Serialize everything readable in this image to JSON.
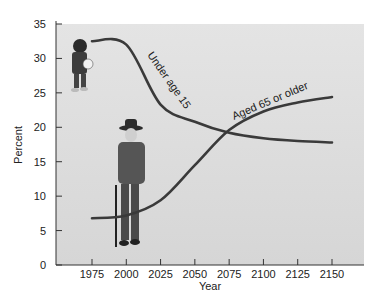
{
  "chart_data": {
    "type": "line",
    "title": "",
    "xlabel": "Year",
    "ylabel": "Percent",
    "xlim": [
      1950,
      2175
    ],
    "ylim": [
      0,
      35
    ],
    "x_ticks": [
      1975,
      2000,
      2025,
      2050,
      2075,
      2100,
      2125,
      2150
    ],
    "y_ticks": [
      0,
      5,
      10,
      15,
      20,
      25,
      30,
      35
    ],
    "grid": false,
    "legend": "inline curve labels",
    "x": [
      1975,
      2000,
      2025,
      2050,
      2075,
      2100,
      2125,
      2150
    ],
    "series": [
      {
        "name": "Under age 15",
        "values": [
          32.5,
          32.0,
          23.3,
          20.8,
          19.2,
          18.4,
          18.0,
          17.8
        ]
      },
      {
        "name": "Aged 65 or older",
        "values": [
          6.8,
          7.2,
          9.4,
          14.5,
          19.6,
          22.3,
          23.6,
          24.4
        ]
      }
    ],
    "annotations": [
      "Photo of child holding a ball beside the Under age 15 curve",
      "Photo of elderly man with cane beside the Aged 65 or older curve"
    ]
  },
  "colors": {
    "plot_background": "#dcdcdc",
    "line": "#3a3a3a",
    "text": "#222222"
  }
}
